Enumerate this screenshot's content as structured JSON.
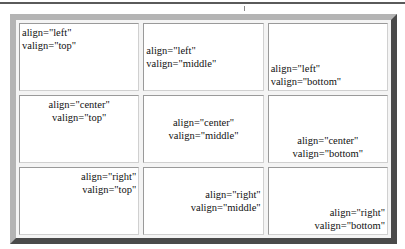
{
  "table": {
    "rows": [
      {
        "cells": [
          {
            "align": "left",
            "valign": "top",
            "line1": "align=\"left\"",
            "line2": "valign=\"top\""
          },
          {
            "align": "left",
            "valign": "middle",
            "line1": "align=\"left\"",
            "line2": "valign=\"middle\""
          },
          {
            "align": "left",
            "valign": "bottom",
            "line1": "align=\"left\"",
            "line2": "valign=\"bottom\""
          }
        ]
      },
      {
        "cells": [
          {
            "align": "center",
            "valign": "top",
            "line1": "align=\"center\"",
            "line2": "valign=\"top\""
          },
          {
            "align": "center",
            "valign": "middle",
            "line1": "align=\"center\"",
            "line2": "valign=\"middle\""
          },
          {
            "align": "center",
            "valign": "bottom",
            "line1": "align=\"center\"",
            "line2": "valign=\"bottom\""
          }
        ]
      },
      {
        "cells": [
          {
            "align": "right",
            "valign": "top",
            "line1": "align=\"right\"",
            "line2": "valign=\"top\""
          },
          {
            "align": "right",
            "valign": "middle",
            "line1": "align=\"right\"",
            "line2": "valign=\"middle\""
          },
          {
            "align": "right",
            "valign": "bottom",
            "line1": "align=\"right\"",
            "line2": "valign=\"bottom\""
          }
        ]
      }
    ]
  },
  "colors": {
    "frame_light": "#b4b4b4",
    "frame_dark": "#4a4a4a",
    "cell_background": "#ffffff",
    "cell_border": "#9a9a9a"
  }
}
